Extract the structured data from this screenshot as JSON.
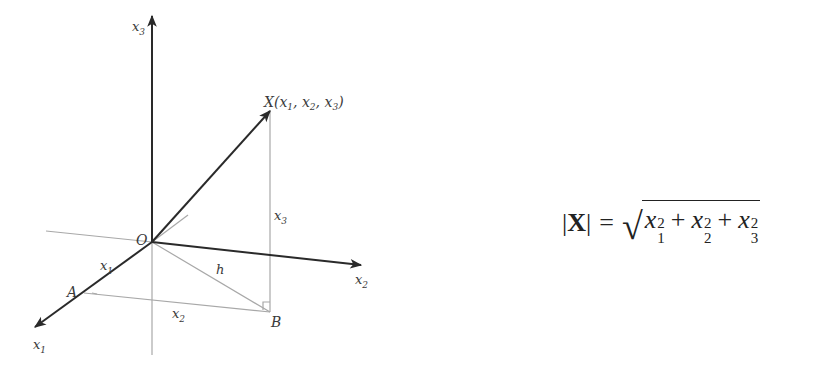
{
  "diagram": {
    "labels": {
      "x3_axis": "x",
      "x3_axis_sub": "3",
      "x2_axis": "x",
      "x2_axis_sub": "2",
      "x1_axis": "x",
      "x1_axis_sub": "1",
      "origin": "O",
      "point_X": "X(x",
      "point_X_full": "X(x1, x2, x3)",
      "point_A": "A",
      "point_B": "B",
      "hyp": "h",
      "seg_x1": "x",
      "seg_x1_sub": "1",
      "seg_x2": "x",
      "seg_x2_sub": "2",
      "seg_x3": "x",
      "seg_x3_sub": "3"
    },
    "colors": {
      "axis": "#2a2a2a",
      "guide": "#a8a8a8",
      "text": "#3a3a3a"
    }
  },
  "formula": {
    "lhs_open": "|",
    "lhs_var": "X",
    "lhs_close": "|",
    "equals": "=",
    "radical": "√",
    "terms": [
      {
        "var": "x",
        "sub": "1",
        "sup": "2"
      },
      {
        "var": "x",
        "sub": "2",
        "sup": "2"
      },
      {
        "var": "x",
        "sub": "3",
        "sup": "2"
      }
    ],
    "plus": "+"
  }
}
